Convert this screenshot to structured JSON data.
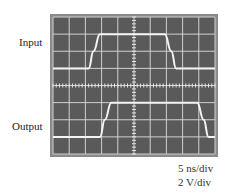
{
  "figure": {
    "labels": {
      "input": "Input",
      "output": "Output"
    },
    "scale": {
      "time": "5 ns/div",
      "voltage": "2 V/div"
    },
    "colors": {
      "screen": "#5a5a5a",
      "frame": "#8a8a8a",
      "grid": "#d8d8d8",
      "trace": "#f2f2f2"
    },
    "grid": {
      "divisions_x": 10,
      "divisions_y": 8
    }
  },
  "chart_data": {
    "type": "line",
    "xlabel": "time (5 ns/div)",
    "ylabel": "voltage (2 V/div)",
    "grid": true,
    "series": [
      {
        "name": "Input",
        "x_div": [
          0,
          2.2,
          2.5,
          2.9,
          6.9,
          7.3,
          7.6,
          10
        ],
        "y_div": [
          0,
          0,
          1,
          2,
          2,
          1,
          0,
          0
        ]
      },
      {
        "name": "Output",
        "x_div": [
          0,
          2.9,
          3.2,
          3.6,
          8.9,
          9.3,
          9.6,
          10
        ],
        "y_div": [
          0,
          0,
          1,
          2,
          2,
          1,
          0,
          0
        ]
      }
    ]
  }
}
